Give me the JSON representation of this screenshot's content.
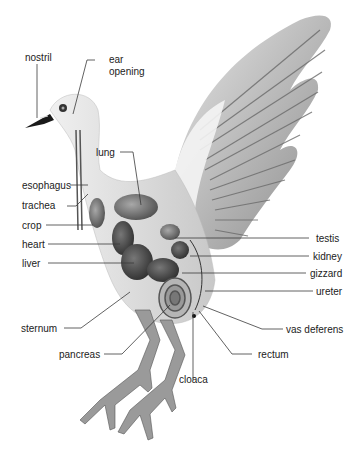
{
  "diagram": {
    "colors": {
      "line": "#3a3a3a",
      "text": "#222222",
      "background": "#ffffff"
    },
    "labels": {
      "nostril": "nostril",
      "ear_opening_1": "ear",
      "ear_opening_2": "opening",
      "lung": "lung",
      "esophagus": "esophagus",
      "trachea": "trachea",
      "crop": "crop",
      "heart": "heart",
      "liver": "liver",
      "testis": "testis",
      "kidney": "kidney",
      "gizzard": "gizzard",
      "ureter": "ureter",
      "sternum": "sternum",
      "vas_deferens": "vas deferens",
      "pancreas": "pancreas",
      "rectum": "rectum",
      "cloaca": "cloaca"
    }
  }
}
